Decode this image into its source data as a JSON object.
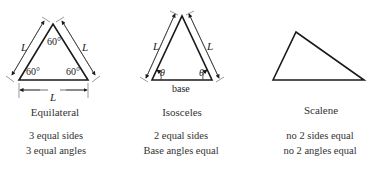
{
  "triangles": [
    {
      "name": "Equilateral",
      "side_label": "L",
      "angles": [
        "60°",
        "60°",
        "60°"
      ],
      "properties": [
        "3 equal sides",
        "3 equal angles"
      ]
    },
    {
      "name": "Isosceles",
      "side_label": "L",
      "angle_symbol": "θ",
      "base_label": "base",
      "properties": [
        "2 equal sides",
        "Base angles equal"
      ]
    },
    {
      "name": "Scalene",
      "properties": [
        "no 2 sides equal",
        "no 2 angles equal"
      ]
    }
  ],
  "colors": {
    "line": "#1a1a1a",
    "text": "#333333"
  }
}
